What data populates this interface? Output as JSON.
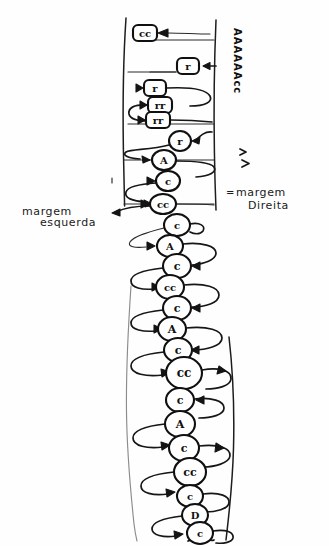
{
  "page": {
    "background_color": "#fefefe",
    "ink_color": "#141414",
    "width": 329,
    "height": 546
  },
  "labels": {
    "left_margin": {
      "line1": "margem",
      "line2": "esquerda",
      "full": "margem esquerda"
    },
    "right_margin": {
      "line1": "margem",
      "line2": "Direita",
      "full": "margem Direita",
      "prefix_mark": "="
    },
    "vertical_note": "AAAAAAcc"
  },
  "margins": {
    "left_line_label": "left-margin-line",
    "right_line_label": "right-margin-line",
    "left_x": 123,
    "right_x": 215,
    "upper_top_y": 18,
    "upper_bottom_y": 207,
    "lower_top_y": 285,
    "lower_bottom_y": 540
  },
  "nodes": [
    {
      "id": "n1",
      "glyph": "cc",
      "shape": "rect",
      "cx": 145,
      "cy": 33,
      "rx": 12,
      "ry": 8,
      "tail": "right"
    },
    {
      "id": "n2",
      "glyph": "r",
      "shape": "rect",
      "cx": 188,
      "cy": 66,
      "rx": 11,
      "ry": 8,
      "tail": "right"
    },
    {
      "id": "n3",
      "glyph": "r",
      "shape": "rect",
      "cx": 155,
      "cy": 88,
      "rx": 11,
      "ry": 8,
      "tail": "left"
    },
    {
      "id": "n4",
      "glyph": "rr",
      "shape": "rect",
      "cx": 160,
      "cy": 105,
      "rx": 12,
      "ry": 8,
      "tail": "left"
    },
    {
      "id": "n5",
      "glyph": "rr",
      "shape": "rect",
      "cx": 158,
      "cy": 120,
      "rx": 12,
      "ry": 8,
      "tail": "left"
    },
    {
      "id": "n6",
      "glyph": "r",
      "shape": "oval",
      "cx": 180,
      "cy": 141,
      "rx": 11,
      "ry": 10,
      "tail": "right"
    },
    {
      "id": "n7",
      "glyph": "A",
      "shape": "oval",
      "cx": 164,
      "cy": 160,
      "rx": 12,
      "ry": 10,
      "tail": "left"
    },
    {
      "id": "n8",
      "glyph": "c",
      "shape": "oval",
      "cx": 168,
      "cy": 181,
      "rx": 12,
      "ry": 10,
      "tail": "left"
    },
    {
      "id": "n9",
      "glyph": "cc",
      "shape": "oval",
      "cx": 163,
      "cy": 204,
      "rx": 13,
      "ry": 10,
      "tail": "left"
    },
    {
      "id": "n10",
      "glyph": "c",
      "shape": "oval",
      "cx": 177,
      "cy": 225,
      "rx": 13,
      "ry": 11,
      "tail": "right"
    },
    {
      "id": "n11",
      "glyph": "A",
      "shape": "oval",
      "cx": 170,
      "cy": 246,
      "rx": 13,
      "ry": 11,
      "tail": "left"
    },
    {
      "id": "n12",
      "glyph": "c",
      "shape": "oval",
      "cx": 177,
      "cy": 266,
      "rx": 14,
      "ry": 12,
      "tail": "right"
    },
    {
      "id": "n13",
      "glyph": "cc",
      "shape": "oval",
      "cx": 170,
      "cy": 287,
      "rx": 14,
      "ry": 12,
      "tail": "left"
    },
    {
      "id": "n14",
      "glyph": "c",
      "shape": "oval",
      "cx": 177,
      "cy": 308,
      "rx": 14,
      "ry": 12,
      "tail": "right"
    },
    {
      "id": "n15",
      "glyph": "A",
      "shape": "oval",
      "cx": 172,
      "cy": 329,
      "rx": 14,
      "ry": 12,
      "tail": "left"
    },
    {
      "id": "n16",
      "glyph": "c",
      "shape": "oval",
      "cx": 178,
      "cy": 350,
      "rx": 14,
      "ry": 12,
      "tail": "right"
    },
    {
      "id": "n17",
      "glyph": "cc",
      "shape": "oval",
      "cx": 184,
      "cy": 373,
      "rx": 18,
      "ry": 16,
      "tail": "right"
    },
    {
      "id": "n18",
      "glyph": "c",
      "shape": "oval",
      "cx": 180,
      "cy": 400,
      "rx": 14,
      "ry": 12,
      "tail": "right"
    },
    {
      "id": "n19",
      "glyph": "A",
      "shape": "oval",
      "cx": 180,
      "cy": 424,
      "rx": 15,
      "ry": 13,
      "tail": "left"
    },
    {
      "id": "n20",
      "glyph": "c",
      "shape": "oval",
      "cx": 184,
      "cy": 448,
      "rx": 15,
      "ry": 13,
      "tail": "right"
    },
    {
      "id": "n21",
      "glyph": "cc",
      "shape": "oval",
      "cx": 190,
      "cy": 472,
      "rx": 16,
      "ry": 14,
      "tail": "left"
    },
    {
      "id": "n22",
      "glyph": "c",
      "shape": "oval",
      "cx": 190,
      "cy": 496,
      "rx": 13,
      "ry": 11,
      "tail": "right"
    },
    {
      "id": "n23",
      "glyph": "D",
      "shape": "oval",
      "cx": 195,
      "cy": 515,
      "rx": 13,
      "ry": 11,
      "tail": "left"
    },
    {
      "id": "n24",
      "glyph": "c",
      "shape": "oval",
      "cx": 200,
      "cy": 533,
      "rx": 13,
      "ry": 11,
      "tail": "right"
    }
  ],
  "stray_marks": [
    {
      "name": "caret-upper-right",
      "x": 243,
      "y": 152
    },
    {
      "name": "caret-lower-right",
      "x": 246,
      "y": 163
    },
    {
      "name": "tick-left-middle",
      "x": 112,
      "y": 180
    }
  ]
}
